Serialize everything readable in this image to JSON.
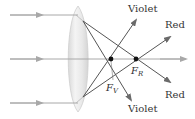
{
  "diagram": {
    "colors": {
      "incident_ray": "#a8a8a8",
      "refracted_ray": "#555555",
      "focal_point": "#111111",
      "lens_fill": "#e6e6e6",
      "lens_edge": "#cfcfcf",
      "axis": "#a8a8a8"
    },
    "labels": {
      "violet_top": "Violet",
      "red_top": "Red",
      "red_bottom": "Red",
      "violet_bottom": "Violet",
      "focal_red_main": "F",
      "focal_red_sub": "R",
      "focal_violet_main": "F",
      "focal_violet_sub": "V"
    },
    "incident_rays": [
      "top",
      "axis",
      "bottom"
    ],
    "focal_points": [
      {
        "name": "F_V",
        "color_of_light": "Violet"
      },
      {
        "name": "F_R",
        "color_of_light": "Red"
      }
    ]
  }
}
